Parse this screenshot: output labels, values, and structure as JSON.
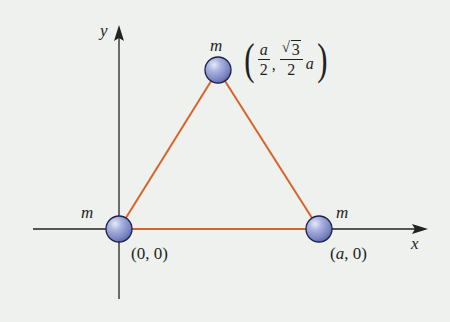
{
  "diagram": {
    "type": "equilateral-triangle-masses",
    "colors": {
      "background": "#eef1ee",
      "axis": "#222222",
      "triangle_edge": "#d9622b",
      "sphere_fill": "#8f9ad0",
      "sphere_edge": "#1d2248"
    },
    "axes": {
      "x_label": "x",
      "y_label": "y"
    },
    "masses": [
      {
        "label": "m",
        "coordinate": "(0, 0)"
      },
      {
        "label": "m",
        "coordinate": "(a, 0)"
      },
      {
        "label": "m",
        "coordinate_parts": {
          "x_num": "a",
          "x_den": "2",
          "comma": ",",
          "y_num_radicand": "3",
          "y_den": "2",
          "y_factor": "a"
        }
      }
    ]
  }
}
